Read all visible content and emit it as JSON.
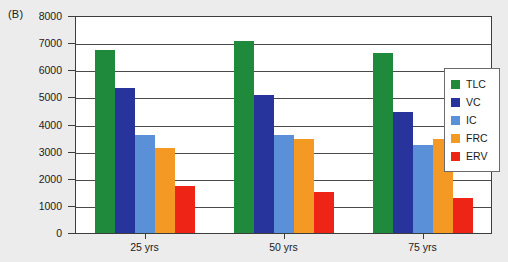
{
  "panel": {
    "label": "(B)"
  },
  "chart_data": {
    "type": "bar",
    "title": "",
    "xlabel": "",
    "ylabel": "",
    "categories": [
      "25 yrs",
      "50 yrs",
      "75 yrs"
    ],
    "ylim": [
      0,
      8000
    ],
    "ytick_step": 1000,
    "yticks": [
      0,
      1000,
      2000,
      3000,
      4000,
      5000,
      6000,
      7000,
      8000
    ],
    "ytick_labels": [
      "0",
      "1000",
      "2000",
      "3000",
      "4000",
      "5000",
      "6000",
      "7000",
      "8000"
    ],
    "grid": true,
    "grid_axis": "y",
    "legend_position": "right-inside",
    "series": [
      {
        "name": "TLC",
        "color": "#1f8a3c",
        "values": [
          6750,
          7080,
          6620
        ]
      },
      {
        "name": "VC",
        "color": "#27349b",
        "values": [
          5330,
          5080,
          4450
        ]
      },
      {
        "name": "IC",
        "color": "#5a90d8",
        "values": [
          3600,
          3620,
          3250
        ]
      },
      {
        "name": "FRC",
        "color": "#f49a24",
        "values": [
          3150,
          3470,
          3450
        ]
      },
      {
        "name": "ERV",
        "color": "#ee2417",
        "values": [
          1720,
          1530,
          1280
        ]
      }
    ]
  },
  "legend": {
    "entries": [
      {
        "label": "TLC",
        "color": "#1f8a3c"
      },
      {
        "label": "VC",
        "color": "#27349b"
      },
      {
        "label": "IC",
        "color": "#5a90d8"
      },
      {
        "label": "FRC",
        "color": "#f49a24"
      },
      {
        "label": "ERV",
        "color": "#ee2417"
      }
    ]
  },
  "colors": {
    "background": "#ececed",
    "plot_background": "#ffffff",
    "axis": "#3d3d3d",
    "gridline": "#4a4a4a",
    "text": "#1b1b1b"
  }
}
